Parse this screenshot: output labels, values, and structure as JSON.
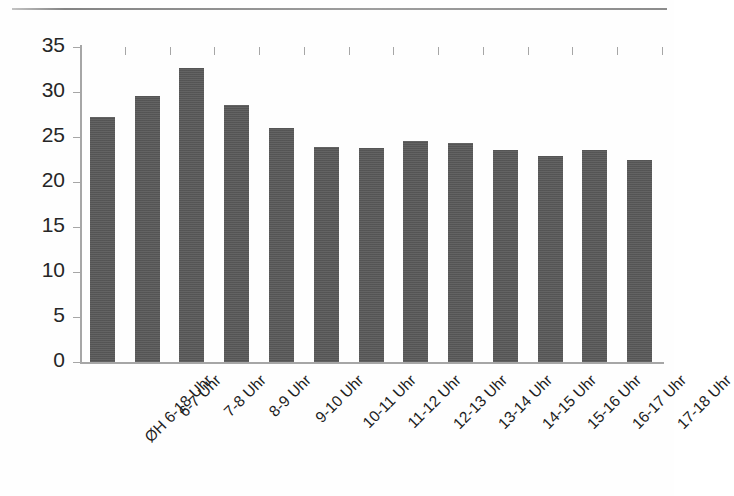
{
  "chart_data": {
    "type": "bar",
    "title": "",
    "subtitle": "",
    "xlabel": "",
    "ylabel": "",
    "ylim": [
      0,
      35
    ],
    "ytick_step": 5,
    "yticks": [
      0,
      5,
      10,
      15,
      20,
      25,
      30,
      35
    ],
    "ytick_labels": [
      "0",
      "5",
      "10",
      "15",
      "20",
      "25",
      "30",
      "35"
    ],
    "grid": false,
    "legend": false,
    "legend_position": "none",
    "bar_color": "#595959",
    "axis_color": "#a6a6a6",
    "categories": [
      "ØH 6-18 Uhr",
      "6-7 Uhr",
      "7-8 Uhr",
      "8-9 Uhr",
      "9-10 Uhr",
      "10-11 Uhr",
      "11-12 Uhr",
      "12-13 Uhr",
      "13-14 Uhr",
      "14-15 Uhr",
      "15-16 Uhr",
      "16-17 Uhr",
      "17-18 Uhr"
    ],
    "values": [
      27.2,
      29.6,
      32.7,
      28.6,
      26.0,
      23.9,
      23.8,
      24.6,
      24.3,
      23.6,
      22.9,
      23.6,
      22.4
    ],
    "series": [
      {
        "name": "",
        "values": [
          27.2,
          29.6,
          32.7,
          28.6,
          26.0,
          23.9,
          23.8,
          24.6,
          24.3,
          23.6,
          22.9,
          23.6,
          22.4
        ]
      }
    ]
  }
}
